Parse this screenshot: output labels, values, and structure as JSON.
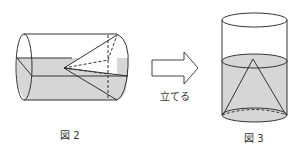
{
  "figures": [
    {
      "id": "fig2",
      "caption": "図 2",
      "description": "horizontal cylinder with cone, partially filled with water"
    },
    {
      "id": "fig3",
      "caption": "図 3",
      "description": "upright cylinder with cone, filled with water"
    }
  ],
  "arrow": {
    "label": "立てる"
  },
  "colors": {
    "water": "#d6d6d6",
    "line": "#333333",
    "background": "#ffffff"
  }
}
